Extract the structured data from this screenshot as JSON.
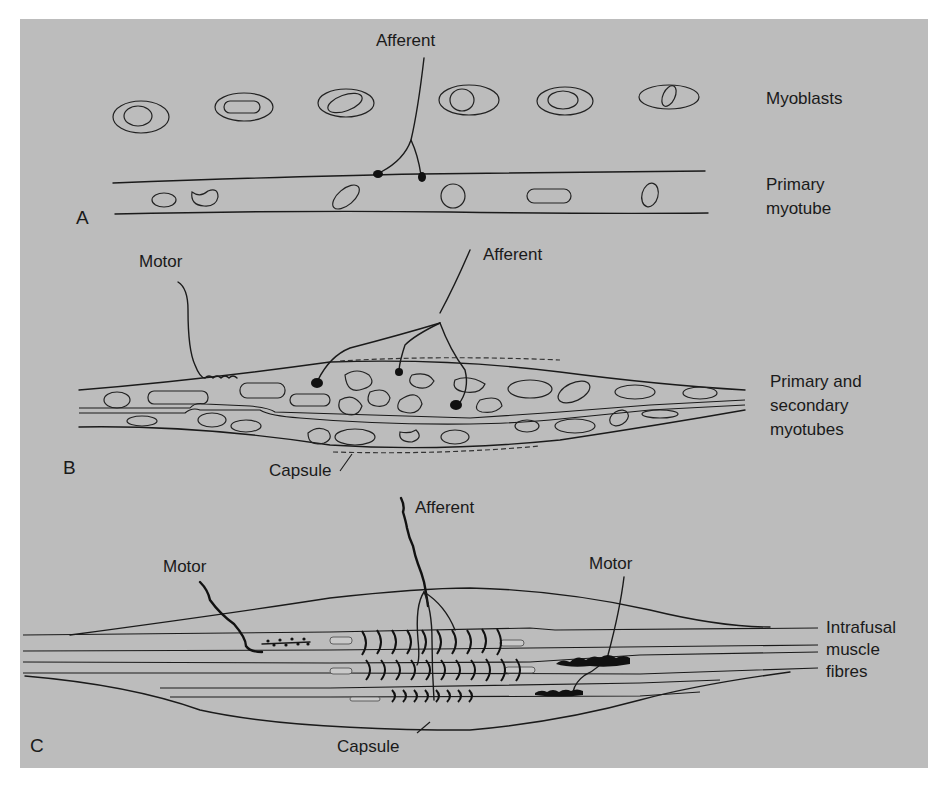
{
  "figure": {
    "background_color": "#bcbcbc",
    "line_color": "#1a1a1a",
    "panels": [
      {
        "letter": "A",
        "labels": {
          "afferent": "Afferent",
          "myoblasts": "Myoblasts",
          "primary_myotube_line1": "Primary",
          "primary_myotube_line2": "myotube"
        }
      },
      {
        "letter": "B",
        "labels": {
          "motor": "Motor",
          "afferent": "Afferent",
          "capsule": "Capsule",
          "myotubes_line1": "Primary and",
          "myotubes_line2": "secondary",
          "myotubes_line3": "myotubes"
        }
      },
      {
        "letter": "C",
        "labels": {
          "afferent": "Afferent",
          "motor_left": "Motor",
          "motor_right": "Motor",
          "capsule": "Capsule",
          "fibres_line1": "Intrafusal",
          "fibres_line2": "muscle",
          "fibres_line3": "fibres"
        }
      }
    ]
  }
}
